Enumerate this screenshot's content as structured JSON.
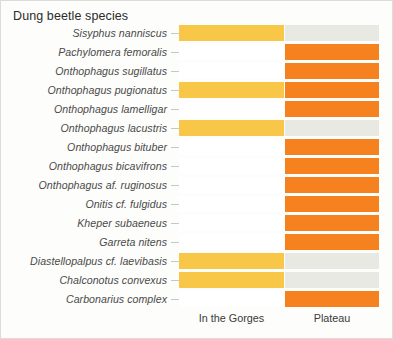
{
  "chart": {
    "title": "Dung beetle species"
  },
  "axis": {
    "columns": [
      {
        "key": "gorges",
        "label": "In the Gorges"
      },
      {
        "key": "plateau",
        "label": "Plateau"
      }
    ]
  },
  "colors": {
    "gorges_present": "#F8C747",
    "plateau_present": "#F5821F",
    "absent": "#E9E9E4",
    "background": "#FDFDFB",
    "empty": "#FFFFFF"
  },
  "chart_data": {
    "type": "heatmap",
    "title": "Dung beetle species",
    "xlabel": "",
    "ylabel": "",
    "categories": [
      "In the Gorges",
      "Plateau"
    ],
    "rows": [
      {
        "species": "Sisyphus nanniscus",
        "gorges": 1,
        "plateau": 0
      },
      {
        "species": "Pachylomera femoralis",
        "gorges": 0,
        "plateau": 1
      },
      {
        "species": "Onthophagus sugillatus",
        "gorges": 0,
        "plateau": 1
      },
      {
        "species": "Onthophagus pugionatus",
        "gorges": 1,
        "plateau": 1
      },
      {
        "species": "Onthophagus lamelligar",
        "gorges": 0,
        "plateau": 1
      },
      {
        "species": "Onthophagus lacustris",
        "gorges": 1,
        "plateau": 0
      },
      {
        "species": "Onthophagus bituber",
        "gorges": 0,
        "plateau": 1
      },
      {
        "species": "Onthophagus bicavifrons",
        "gorges": 0,
        "plateau": 1
      },
      {
        "species": "Onthophagus af. ruginosus",
        "gorges": 0,
        "plateau": 1
      },
      {
        "species": "Onitis cf. fulgidus",
        "gorges": 0,
        "plateau": 1
      },
      {
        "species": "Kheper subaeneus",
        "gorges": 0,
        "plateau": 1
      },
      {
        "species": "Garreta nitens",
        "gorges": 0,
        "plateau": 1
      },
      {
        "species": "Diastellopalpus cf. laevibasis",
        "gorges": 1,
        "plateau": 0
      },
      {
        "species": "Chalconotus convexus",
        "gorges": 1,
        "plateau": 0
      },
      {
        "species": "Carbonarius complex",
        "gorges": 0,
        "plateau": 1
      }
    ],
    "legend": [],
    "grid": false,
    "note": "Filled cell = species present at that site. Gorges present = yellow, Plateau present = orange, absent = light grey."
  }
}
